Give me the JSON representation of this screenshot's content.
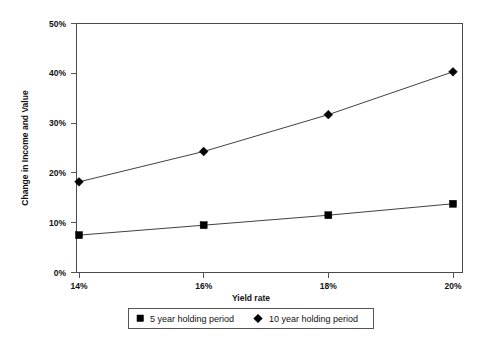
{
  "chart_data": {
    "type": "line",
    "title": "",
    "xlabel": "Yield rate",
    "ylabel": "Change in Income and Value",
    "categories": [
      "14%",
      "16%",
      "18%",
      "20%"
    ],
    "x": [
      14,
      16,
      18,
      20
    ],
    "xlim": [
      14,
      20
    ],
    "ylim": [
      0,
      50
    ],
    "y_ticks": [
      0,
      10,
      20,
      30,
      40,
      50
    ],
    "y_tick_labels": [
      "0%",
      "10%",
      "20%",
      "30%",
      "40%",
      "50%"
    ],
    "x_tick_labels": [
      "14%",
      "16%",
      "18%",
      "20%"
    ],
    "grid": false,
    "legend_position": "bottom-center",
    "series": [
      {
        "name": "5 year holding period",
        "marker": "square",
        "color": "#000000",
        "values": [
          7.5,
          9.5,
          11.5,
          13.8
        ]
      },
      {
        "name": "10 year holding period",
        "marker": "diamond",
        "color": "#000000",
        "values": [
          18.2,
          24.3,
          31.7,
          40.3
        ]
      }
    ]
  },
  "axes": {
    "y_label": "Change in Income and Value",
    "x_label": "Yield rate",
    "y_ticks": [
      {
        "label": "50%"
      },
      {
        "label": "40%"
      },
      {
        "label": "30%"
      },
      {
        "label": "20%"
      },
      {
        "label": "10%"
      },
      {
        "label": "0%"
      }
    ],
    "x_ticks": [
      {
        "label": "14%"
      },
      {
        "label": "16%"
      },
      {
        "label": "18%"
      },
      {
        "label": "20%"
      }
    ]
  },
  "legend": {
    "items": [
      {
        "label": "5 year holding period",
        "marker": "square-marker"
      },
      {
        "label": "10 year holding period",
        "marker": "diamond-marker"
      }
    ]
  }
}
